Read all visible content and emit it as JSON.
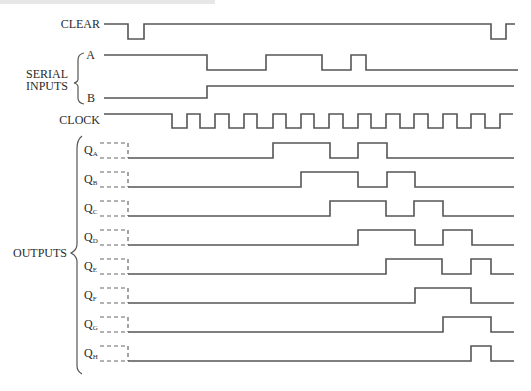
{
  "title": "",
  "labels": {
    "clear": "CLEAR",
    "serial_inputs_line1": "SERIAL",
    "serial_inputs_line2": "INPUTS",
    "input_a": "A",
    "input_b": "B",
    "clock": "CLOCK",
    "outputs": "OUTPUTS",
    "q_prefix": "Q",
    "output_subscripts": [
      "A",
      "B",
      "C",
      "D",
      "E",
      "F",
      "G",
      "H"
    ]
  },
  "colors": {
    "trace": "#555555",
    "text": "#2a2a2a",
    "background": "#ffffff"
  },
  "clock_rising_edges_x": [
    187,
    215,
    244,
    273,
    301,
    329,
    358,
    386,
    414,
    443,
    471,
    500
  ],
  "signals": {
    "clear": {
      "high": 24,
      "low": 39,
      "start": 104,
      "end": 515,
      "initial": "high",
      "transitions": [
        128,
        144,
        491,
        506
      ]
    },
    "serial_a": {
      "high": 55,
      "low": 70,
      "start": 104,
      "end": 518,
      "initial": "high",
      "transitions": [
        207,
        266,
        322,
        351,
        366
      ]
    },
    "serial_b": {
      "high": 86,
      "low": 98,
      "start": 104,
      "end": 514,
      "initial": "low",
      "transitions": [
        207
      ]
    },
    "clock": {
      "high": 114,
      "low": 128,
      "start": 104,
      "end": 513,
      "initial": "high",
      "transitions": [
        172,
        187,
        200,
        215,
        229,
        244,
        257,
        273,
        286,
        301,
        314,
        329,
        343,
        358,
        371,
        386,
        400,
        414,
        428,
        443,
        457,
        471,
        485,
        500
      ]
    }
  },
  "outputs": [
    {
      "name": "QA",
      "sub": "A",
      "high": 143,
      "low": 158,
      "transitions": [
        273,
        330,
        358,
        387
      ]
    },
    {
      "name": "QB",
      "sub": "B",
      "high": 172,
      "low": 187,
      "transitions": [
        301,
        358,
        387,
        415
      ]
    },
    {
      "name": "QC",
      "sub": "C",
      "high": 201,
      "low": 216,
      "transitions": [
        330,
        386,
        414,
        443
      ]
    },
    {
      "name": "QD",
      "sub": "D",
      "high": 230,
      "low": 245,
      "transitions": [
        358,
        415,
        443,
        472
      ]
    },
    {
      "name": "QE",
      "sub": "E",
      "high": 259,
      "low": 274,
      "transitions": [
        386,
        442,
        471,
        491
      ]
    },
    {
      "name": "QF",
      "sub": "F",
      "high": 288,
      "low": 303,
      "transitions": [
        415,
        471
      ]
    },
    {
      "name": "QG",
      "sub": "G",
      "high": 317,
      "low": 332,
      "transitions": [
        443,
        491
      ]
    },
    {
      "name": "QH",
      "sub": "H",
      "high": 346,
      "low": 361,
      "transitions": [
        471,
        491
      ]
    }
  ],
  "output_layout": {
    "dash_start": 100,
    "dash_end": 128,
    "solid_end": 514
  }
}
